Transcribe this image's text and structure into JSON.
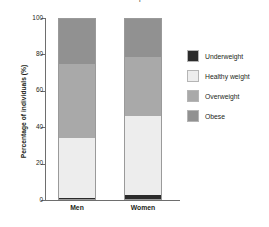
{
  "chart_data": {
    "type": "bar",
    "subtype": "stacked-bar-100",
    "title": "and women in a sample",
    "xlabel": "",
    "ylabel": "Percentage of individuals (%)",
    "ylim": [
      0,
      100
    ],
    "yticks": [
      0,
      20,
      40,
      60,
      80,
      100
    ],
    "ytick_labels": [
      "0",
      "20",
      "40",
      "60",
      "80",
      "100"
    ],
    "grid": false,
    "legend_position": "right",
    "categories": [
      "Men",
      "Women"
    ],
    "series": [
      {
        "name": "Underweight",
        "color": "#2b2b2b",
        "values": [
          0.5,
          2
        ]
      },
      {
        "name": "Healthy weight",
        "color": "#ededed",
        "values": [
          33.5,
          44
        ]
      },
      {
        "name": "Overweight",
        "color": "#a9a9a9",
        "values": [
          41,
          33
        ]
      },
      {
        "name": "Obese",
        "color": "#919191",
        "values": [
          25,
          21
        ]
      }
    ],
    "stack_boundaries": {
      "Men": [
        0.5,
        34,
        75,
        100
      ],
      "Women": [
        2,
        46,
        79,
        100
      ]
    }
  },
  "legend": {
    "items": [
      {
        "label": "Underweight",
        "color": "#2b2b2b"
      },
      {
        "label": "Healthy weight",
        "color": "#ededed"
      },
      {
        "label": "Overweight",
        "color": "#a9a9a9"
      },
      {
        "label": "Obese",
        "color": "#919191"
      }
    ]
  }
}
